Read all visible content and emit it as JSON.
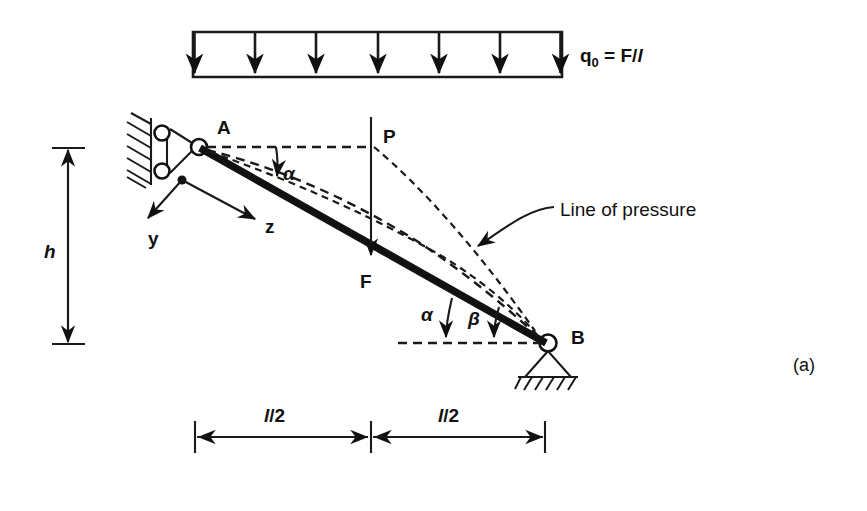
{
  "figure": {
    "part_label": "(a)",
    "caption_note": "Simply supported inclined beam with uniform load, line of pressure"
  },
  "load": {
    "label_main": "q",
    "label_sub": "0",
    "label_eq": " = F/",
    "label_unit": "l",
    "arrow_count": 7,
    "band_left_px": 193,
    "band_right_px": 562,
    "band_top_px": 32,
    "band_bottom_px": 77
  },
  "points": {
    "A": "A",
    "B": "B",
    "P": "P",
    "F": "F"
  },
  "axes": {
    "y": "y",
    "z": "z"
  },
  "angles": {
    "alpha_top": "α",
    "alpha_bottom": "α",
    "beta": "β"
  },
  "annotations": {
    "line_of_pressure": "Line of pressure"
  },
  "dimensions": {
    "height": "h",
    "span_left": "l/2",
    "span_right": "l/2",
    "span_left_italic": "l",
    "span_left_rest": "/2",
    "span_right_italic": "l",
    "span_right_rest": "/2"
  },
  "colors": {
    "ink": "#111111",
    "background": "#ffffff"
  },
  "geometry": {
    "beam_start": [
      197,
      146
    ],
    "beam_end": [
      545,
      342
    ],
    "load_point_F": [
      371,
      257
    ],
    "point_P": [
      371,
      146
    ],
    "height_dim_top": 148,
    "height_dim_bottom": 344,
    "dim_left": 195,
    "dim_mid": 371,
    "dim_right": 545,
    "dim_y": 437
  }
}
